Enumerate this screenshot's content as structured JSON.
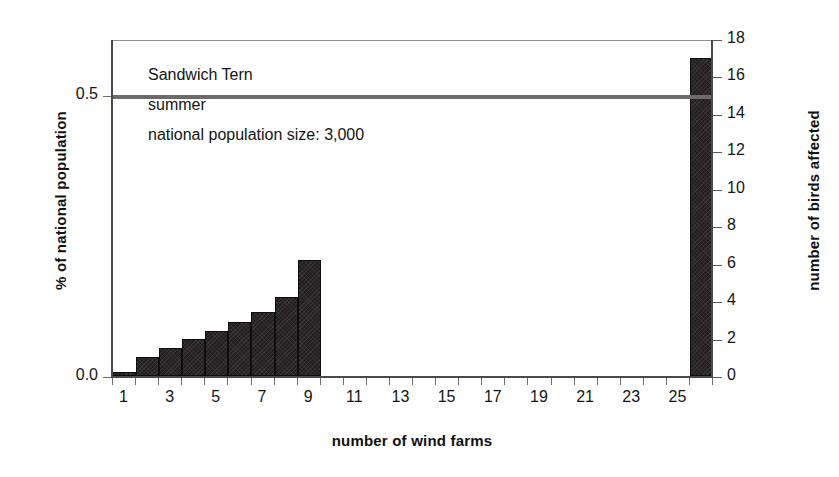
{
  "chart_data": {
    "type": "bar",
    "title": "",
    "xlabel": "number of wind farms",
    "ylabel": "% of national population",
    "ylabel_right": "number of birds affected",
    "categories": [
      1,
      2,
      3,
      4,
      5,
      6,
      7,
      8,
      9,
      10,
      11,
      12,
      13,
      14,
      15,
      16,
      17,
      18,
      19,
      20,
      21,
      22,
      23,
      24,
      25,
      26
    ],
    "values": [
      0.2,
      1.0,
      1.5,
      2.0,
      2.4,
      2.9,
      3.4,
      4.2,
      6.2,
      0,
      0,
      0,
      0,
      0,
      0,
      0,
      0,
      0,
      0,
      0,
      0,
      0,
      0,
      0,
      0,
      17.0
    ],
    "value_units": "number of birds affected",
    "ylim": [
      0,
      18
    ],
    "ylim_right": [
      0,
      18
    ],
    "yticks_left": [
      {
        "label": "0.0",
        "value": 0
      },
      {
        "label": "0.5",
        "value": 15
      }
    ],
    "yticks_right": [
      {
        "label": "0",
        "value": 0
      },
      {
        "label": "2",
        "value": 2
      },
      {
        "label": "4",
        "value": 4
      },
      {
        "label": "6",
        "value": 6
      },
      {
        "label": "8",
        "value": 8
      },
      {
        "label": "10",
        "value": 10
      },
      {
        "label": "12",
        "value": 12
      },
      {
        "label": "14",
        "value": 14
      },
      {
        "label": "16",
        "value": 16
      },
      {
        "label": "18",
        "value": 18
      }
    ],
    "xticks": [
      {
        "label": "1",
        "value": 1
      },
      {
        "label": "3",
        "value": 3
      },
      {
        "label": "5",
        "value": 5
      },
      {
        "label": "7",
        "value": 7
      },
      {
        "label": "9",
        "value": 9
      },
      {
        "label": "11",
        "value": 11
      },
      {
        "label": "13",
        "value": 13
      },
      {
        "label": "15",
        "value": 15
      },
      {
        "label": "17",
        "value": 17
      },
      {
        "label": "19",
        "value": 19
      },
      {
        "label": "21",
        "value": 21
      },
      {
        "label": "23",
        "value": 23
      },
      {
        "label": "25",
        "value": 25
      }
    ],
    "xtick_minor": [
      2,
      4,
      6,
      8,
      10,
      12,
      14,
      16,
      18,
      20,
      22,
      24,
      26
    ],
    "grid": false,
    "legend": false,
    "reference_line": {
      "label": "0.5",
      "value": 15,
      "color": "#6b6b6b"
    },
    "bar_color": "#231f20",
    "annotations": [
      "Sandwich Tern",
      "summer",
      "national population size: 3,000"
    ]
  }
}
